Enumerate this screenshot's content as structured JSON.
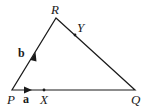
{
  "diagram": {
    "type": "triangle",
    "vertices": {
      "P": {
        "label": "P",
        "x": 12,
        "y": 90
      },
      "Q": {
        "label": "Q",
        "x": 135,
        "y": 90
      },
      "R": {
        "label": "R",
        "x": 56,
        "y": 18
      }
    },
    "points": {
      "X": {
        "label": "X",
        "x": 44,
        "y": 90,
        "on": "PQ"
      },
      "Y": {
        "label": "Y",
        "x": 76,
        "y": 35,
        "on": "RQ"
      }
    },
    "vectors": {
      "a": {
        "label": "a",
        "from": "P",
        "along": "PQ"
      },
      "b": {
        "label": "b",
        "from": "P",
        "along": "PR"
      }
    },
    "stroke_color": "#1a1a1a"
  }
}
